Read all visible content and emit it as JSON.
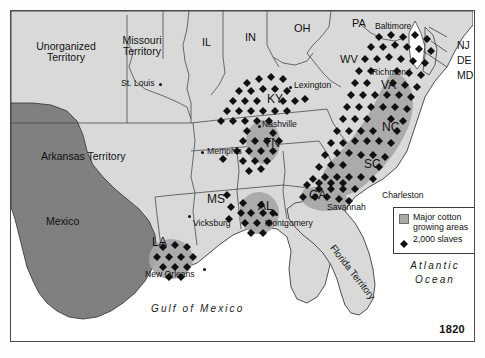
{
  "map": {
    "title_year": "1820",
    "colors": {
      "land": "#d9d9d9",
      "water": "#ffffff",
      "foreign": "#808080",
      "cotton_area": "#a9a9a9",
      "slave_dot": "#111111",
      "border": "#4a4a4a"
    },
    "territories": [
      {
        "name": "unorganized-territory",
        "label": "Unorganized\nTerritory",
        "line1": "Unorganized",
        "line2": "Territory",
        "x": 22,
        "y": 38
      },
      {
        "name": "missouri-territory",
        "label": "Missouri\nTerritory",
        "line1": "Missouri",
        "line2": "Territory",
        "x": 113,
        "y": 32
      },
      {
        "name": "arkansas-territory",
        "label": "Arkansas Territory",
        "line1": "Arkansas Territory",
        "line2": "",
        "x": 34,
        "y": 145
      },
      {
        "name": "mexico",
        "label": "Mexico",
        "line1": "Mexico",
        "line2": "",
        "x": 37,
        "y": 212
      },
      {
        "name": "florida-territory",
        "label": "Florida Territory",
        "line1": "Florida Territory",
        "line2": "",
        "x": 325,
        "y": 232
      }
    ],
    "states": [
      {
        "code": "IL",
        "x": 193,
        "y": 30
      },
      {
        "code": "IN",
        "x": 236,
        "y": 25
      },
      {
        "code": "OH",
        "x": 285,
        "y": 16
      },
      {
        "code": "PA",
        "x": 343,
        "y": 10
      },
      {
        "code": "WV",
        "x": 331,
        "y": 47
      },
      {
        "code": "KY",
        "x": 258,
        "y": 86
      },
      {
        "code": "TN",
        "x": 255,
        "y": 130
      },
      {
        "code": "VA",
        "x": 372,
        "y": 72
      },
      {
        "code": "NC",
        "x": 373,
        "y": 114
      },
      {
        "code": "SC",
        "x": 355,
        "y": 151
      },
      {
        "code": "GA",
        "x": 300,
        "y": 182
      },
      {
        "code": "AL",
        "x": 249,
        "y": 193
      },
      {
        "code": "MS",
        "x": 198,
        "y": 186
      },
      {
        "code": "LA",
        "x": 143,
        "y": 229
      },
      {
        "code": "NJ",
        "x": 448,
        "y": 33
      },
      {
        "code": "DE",
        "x": 448,
        "y": 48
      },
      {
        "code": "MD",
        "x": 448,
        "y": 63
      }
    ],
    "cities": [
      {
        "name": "St. Louis",
        "label": "St. Louis",
        "x": 112,
        "y": 72,
        "dot_x": 179,
        "dot_y": 76
      },
      {
        "name": "Memphis",
        "label": "Memphis",
        "x": 196,
        "y": 140,
        "dot_x": 191,
        "dot_y": 143
      },
      {
        "name": "Nashville",
        "label": "Nashville",
        "x": 253,
        "y": 113,
        "dot_x": 249,
        "dot_y": 118
      },
      {
        "name": "Lexington",
        "label": "Lexington",
        "x": 283,
        "y": 74,
        "dot_x": 279,
        "dot_y": 78
      },
      {
        "name": "Baltimore",
        "label": "Baltimore",
        "x": 366,
        "y": 14,
        "dot_x": 0,
        "dot_y": 0
      },
      {
        "name": "Richmond",
        "label": "Richmond",
        "x": 363,
        "y": 61,
        "dot_x": 0,
        "dot_y": 0
      },
      {
        "name": "Charleston",
        "label": "Charleston",
        "x": 372,
        "y": 184,
        "dot_x": 0,
        "dot_y": 0
      },
      {
        "name": "Savannah",
        "label": "Savannah",
        "x": 318,
        "y": 196,
        "dot_x": 0,
        "dot_y": 0
      },
      {
        "name": "Montgomery",
        "label": "Montgomery",
        "x": 256,
        "y": 212,
        "dot_x": 265,
        "dot_y": 206
      },
      {
        "name": "Vicksburg",
        "label": "Vicksburg",
        "x": 184,
        "y": 212,
        "dot_x": 179,
        "dot_y": 208
      },
      {
        "name": "New Orleans",
        "label": "New Orleans",
        "x": 136,
        "y": 263,
        "dot_x": 194,
        "dot_y": 260
      }
    ],
    "water_labels": [
      {
        "name": "gulf-of-mexico",
        "label": "Gulf of Mexico",
        "x": 160,
        "y": 297
      },
      {
        "name": "atlantic-ocean-line1",
        "label": "Atlantic",
        "x": 403,
        "y": 255
      },
      {
        "name": "atlantic-ocean-line2",
        "label": "Ocean",
        "x": 403,
        "y": 268
      }
    ],
    "legend": {
      "cotton_label_line1": "Major cotton",
      "cotton_label_line2": "growing areas",
      "slaves_label": "2,000 slaves"
    }
  }
}
